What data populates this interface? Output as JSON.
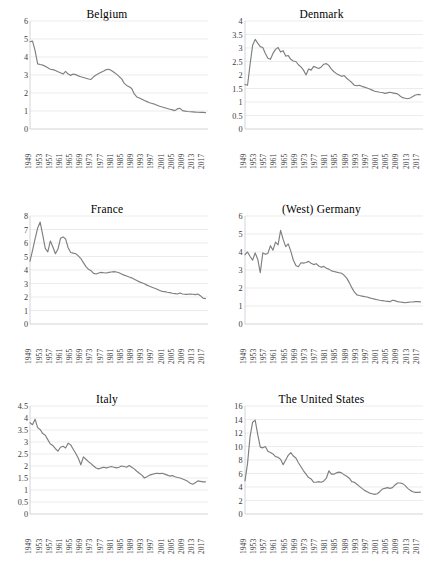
{
  "figure": {
    "panels": [
      {
        "id": "belgium",
        "title": "Belgium",
        "ylim": [
          0,
          6
        ],
        "yticks": [
          "0",
          "1",
          "2",
          "3",
          "4",
          "5",
          "6"
        ],
        "ytick_values": [
          0,
          1,
          2,
          3,
          4,
          5,
          6
        ]
      },
      {
        "id": "denmark",
        "title": "Denmark",
        "ylim": [
          0,
          4
        ],
        "yticks": [
          "0",
          "0.5",
          "1",
          "1.5",
          "2",
          "2.5",
          "3",
          "3.5",
          "4"
        ],
        "ytick_values": [
          0,
          0.5,
          1,
          1.5,
          2,
          2.5,
          3,
          3.5,
          4
        ]
      },
      {
        "id": "france",
        "title": "France",
        "ylim": [
          0,
          8
        ],
        "yticks": [
          "0",
          "1",
          "2",
          "3",
          "4",
          "5",
          "6",
          "7",
          "8"
        ],
        "ytick_values": [
          0,
          1,
          2,
          3,
          4,
          5,
          6,
          7,
          8
        ]
      },
      {
        "id": "west-germany",
        "title": "(West) Germany",
        "ylim": [
          0,
          6
        ],
        "yticks": [
          "0",
          "1",
          "2",
          "3",
          "4",
          "5",
          "6"
        ],
        "ytick_values": [
          0,
          1,
          2,
          3,
          4,
          5,
          6
        ]
      },
      {
        "id": "italy",
        "title": "Italy",
        "ylim": [
          0,
          4.5
        ],
        "yticks": [
          "0",
          "0.5",
          "1",
          "1.5",
          "2",
          "2.5",
          "3",
          "3.5",
          "4",
          "4.5"
        ],
        "ytick_values": [
          0,
          0.5,
          1,
          1.5,
          2,
          2.5,
          3,
          3.5,
          4,
          4.5
        ]
      },
      {
        "id": "united-states",
        "title": "The United States",
        "ylim": [
          0,
          16
        ],
        "yticks": [
          "0",
          "2",
          "4",
          "6",
          "8",
          "10",
          "12",
          "14",
          "16"
        ],
        "ytick_values": [
          0,
          2,
          4,
          6,
          8,
          10,
          12,
          14,
          16
        ]
      }
    ],
    "xticks": [
      "1949",
      "1953",
      "1957",
      "1961",
      "1965",
      "1969",
      "1973",
      "1977",
      "1981",
      "1985",
      "1989",
      "1993",
      "1997",
      "2001",
      "2005",
      "2009",
      "2013",
      "2017"
    ],
    "xlim": [
      1949,
      2019
    ],
    "line_color": "#7f7f7f",
    "gridline_color": "#e4e4e4"
  },
  "chart_data": [
    {
      "type": "line",
      "title": "Belgium",
      "xlabel": "",
      "ylabel": "",
      "ylim": [
        0,
        6
      ],
      "xlim": [
        1949,
        2019
      ],
      "grid": true,
      "legend": "none",
      "x": [
        1949,
        1950,
        1951,
        1952,
        1953,
        1954,
        1955,
        1956,
        1957,
        1958,
        1959,
        1960,
        1961,
        1962,
        1963,
        1964,
        1965,
        1966,
        1967,
        1968,
        1969,
        1970,
        1971,
        1972,
        1973,
        1974,
        1975,
        1976,
        1977,
        1978,
        1979,
        1980,
        1981,
        1982,
        1983,
        1984,
        1985,
        1986,
        1987,
        1988,
        1989,
        1990,
        1991,
        1992,
        1993,
        1994,
        1995,
        1996,
        1997,
        1998,
        1999,
        2000,
        2001,
        2002,
        2003,
        2004,
        2005,
        2006,
        2007,
        2008,
        2009,
        2010,
        2011,
        2012,
        2013,
        2014,
        2015,
        2016,
        2017,
        2018
      ],
      "values": [
        4.85,
        4.88,
        4.35,
        3.62,
        3.58,
        3.55,
        3.48,
        3.4,
        3.32,
        3.3,
        3.25,
        3.18,
        3.12,
        3.05,
        3.2,
        3.05,
        2.98,
        3.05,
        3.02,
        2.95,
        2.9,
        2.86,
        2.82,
        2.78,
        2.76,
        2.9,
        3.0,
        3.08,
        3.15,
        3.22,
        3.3,
        3.32,
        3.25,
        3.15,
        3.05,
        2.92,
        2.8,
        2.55,
        2.42,
        2.35,
        2.25,
        1.95,
        1.78,
        1.72,
        1.65,
        1.58,
        1.52,
        1.46,
        1.42,
        1.38,
        1.32,
        1.26,
        1.22,
        1.18,
        1.14,
        1.1,
        1.06,
        1.02,
        1.12,
        1.15,
        1.02,
        0.99,
        0.97,
        0.96,
        0.95,
        0.94,
        0.93,
        0.92,
        0.92,
        0.91
      ]
    },
    {
      "type": "line",
      "title": "Denmark",
      "xlabel": "",
      "ylabel": "",
      "ylim": [
        0,
        4
      ],
      "xlim": [
        1949,
        2019
      ],
      "grid": true,
      "legend": "none",
      "x": [
        1949,
        1950,
        1951,
        1952,
        1953,
        1954,
        1955,
        1956,
        1957,
        1958,
        1959,
        1960,
        1961,
        1962,
        1963,
        1964,
        1965,
        1966,
        1967,
        1968,
        1969,
        1970,
        1971,
        1972,
        1973,
        1974,
        1975,
        1976,
        1977,
        1978,
        1979,
        1980,
        1981,
        1982,
        1983,
        1984,
        1985,
        1986,
        1987,
        1988,
        1989,
        1990,
        1991,
        1992,
        1993,
        1994,
        1995,
        1996,
        1997,
        1998,
        1999,
        2000,
        2001,
        2002,
        2003,
        2004,
        2005,
        2006,
        2007,
        2008,
        2009,
        2010,
        2011,
        2012,
        2013,
        2014,
        2015,
        2016,
        2017,
        2018
      ],
      "values": [
        1.65,
        1.62,
        2.4,
        3.1,
        3.32,
        3.18,
        3.05,
        3.02,
        2.8,
        2.62,
        2.58,
        2.8,
        2.95,
        3.02,
        2.85,
        2.9,
        2.7,
        2.72,
        2.58,
        2.52,
        2.5,
        2.38,
        2.3,
        2.18,
        2.0,
        2.22,
        2.18,
        2.32,
        2.28,
        2.24,
        2.3,
        2.4,
        2.42,
        2.35,
        2.22,
        2.12,
        2.05,
        2.0,
        1.95,
        1.98,
        1.88,
        1.8,
        1.72,
        1.62,
        1.6,
        1.62,
        1.58,
        1.55,
        1.52,
        1.48,
        1.44,
        1.4,
        1.38,
        1.36,
        1.35,
        1.32,
        1.34,
        1.36,
        1.34,
        1.32,
        1.3,
        1.22,
        1.16,
        1.14,
        1.12,
        1.15,
        1.2,
        1.26,
        1.28,
        1.27
      ]
    },
    {
      "type": "line",
      "title": "France",
      "xlabel": "",
      "ylabel": "",
      "ylim": [
        0,
        8
      ],
      "xlim": [
        1949,
        2019
      ],
      "grid": true,
      "legend": "none",
      "x": [
        1949,
        1950,
        1951,
        1952,
        1953,
        1954,
        1955,
        1956,
        1957,
        1958,
        1959,
        1960,
        1961,
        1962,
        1963,
        1964,
        1965,
        1966,
        1967,
        1968,
        1969,
        1970,
        1971,
        1972,
        1973,
        1974,
        1975,
        1976,
        1977,
        1978,
        1979,
        1980,
        1981,
        1982,
        1983,
        1984,
        1985,
        1986,
        1987,
        1988,
        1989,
        1990,
        1991,
        1992,
        1993,
        1994,
        1995,
        1996,
        1997,
        1998,
        1999,
        2000,
        2001,
        2002,
        2003,
        2004,
        2005,
        2006,
        2007,
        2008,
        2009,
        2010,
        2011,
        2012,
        2013,
        2014,
        2015,
        2016,
        2017,
        2018
      ],
      "values": [
        4.65,
        5.45,
        6.3,
        7.1,
        7.55,
        6.6,
        5.6,
        5.35,
        6.15,
        5.7,
        5.2,
        5.55,
        6.35,
        6.45,
        6.3,
        5.65,
        5.3,
        5.25,
        5.2,
        5.05,
        4.85,
        4.55,
        4.25,
        4.05,
        3.95,
        3.75,
        3.7,
        3.78,
        3.82,
        3.8,
        3.78,
        3.82,
        3.85,
        3.88,
        3.85,
        3.8,
        3.7,
        3.62,
        3.55,
        3.48,
        3.42,
        3.32,
        3.22,
        3.12,
        3.05,
        2.98,
        2.88,
        2.8,
        2.72,
        2.65,
        2.58,
        2.48,
        2.42,
        2.4,
        2.35,
        2.32,
        2.28,
        2.25,
        2.22,
        2.3,
        2.22,
        2.2,
        2.2,
        2.22,
        2.2,
        2.18,
        2.22,
        2.1,
        1.92,
        1.88
      ]
    },
    {
      "type": "line",
      "title": "(West) Germany",
      "xlabel": "",
      "ylabel": "",
      "ylim": [
        0,
        6
      ],
      "xlim": [
        1949,
        2019
      ],
      "grid": true,
      "legend": "none",
      "x": [
        1949,
        1950,
        1951,
        1952,
        1953,
        1954,
        1955,
        1956,
        1957,
        1958,
        1959,
        1960,
        1961,
        1962,
        1963,
        1964,
        1965,
        1966,
        1967,
        1968,
        1969,
        1970,
        1971,
        1972,
        1973,
        1974,
        1975,
        1976,
        1977,
        1978,
        1979,
        1980,
        1981,
        1982,
        1983,
        1984,
        1985,
        1986,
        1987,
        1988,
        1989,
        1990,
        1991,
        1992,
        1993,
        1994,
        1995,
        1996,
        1997,
        1998,
        1999,
        2000,
        2001,
        2002,
        2003,
        2004,
        2005,
        2006,
        2007,
        2008,
        2009,
        2010,
        2011,
        2012,
        2013,
        2014,
        2015,
        2016,
        2017,
        2018
      ],
      "values": [
        3.85,
        4.0,
        3.75,
        3.55,
        3.95,
        3.6,
        2.85,
        3.95,
        3.88,
        3.92,
        4.35,
        4.1,
        4.55,
        4.4,
        5.2,
        4.7,
        4.3,
        4.45,
        4.05,
        3.55,
        3.25,
        3.18,
        3.4,
        3.38,
        3.42,
        3.48,
        3.38,
        3.3,
        3.35,
        3.22,
        3.15,
        3.2,
        3.1,
        3.05,
        2.95,
        2.92,
        2.88,
        2.85,
        2.82,
        2.7,
        2.55,
        2.3,
        2.02,
        1.78,
        1.62,
        1.58,
        1.55,
        1.52,
        1.5,
        1.45,
        1.42,
        1.38,
        1.35,
        1.32,
        1.3,
        1.28,
        1.26,
        1.24,
        1.32,
        1.3,
        1.24,
        1.22,
        1.2,
        1.18,
        1.2,
        1.22,
        1.22,
        1.24,
        1.24,
        1.23
      ]
    },
    {
      "type": "line",
      "title": "Italy",
      "xlabel": "",
      "ylabel": "",
      "ylim": [
        0,
        4.5
      ],
      "xlim": [
        1949,
        2019
      ],
      "grid": true,
      "legend": "none",
      "x": [
        1949,
        1950,
        1951,
        1952,
        1953,
        1954,
        1955,
        1956,
        1957,
        1958,
        1959,
        1960,
        1961,
        1962,
        1963,
        1964,
        1965,
        1966,
        1967,
        1968,
        1969,
        1970,
        1971,
        1972,
        1973,
        1974,
        1975,
        1976,
        1977,
        1978,
        1979,
        1980,
        1981,
        1982,
        1983,
        1984,
        1985,
        1986,
        1987,
        1988,
        1989,
        1990,
        1991,
        1992,
        1993,
        1994,
        1995,
        1996,
        1997,
        1998,
        1999,
        2000,
        2001,
        2002,
        2003,
        2004,
        2005,
        2006,
        2007,
        2008,
        2009,
        2010,
        2011,
        2012,
        2013,
        2014,
        2015,
        2016,
        2017,
        2018
      ],
      "values": [
        3.8,
        3.72,
        3.95,
        3.6,
        3.52,
        3.35,
        3.28,
        3.1,
        2.92,
        2.85,
        2.72,
        2.62,
        2.78,
        2.82,
        2.75,
        2.95,
        2.88,
        2.7,
        2.52,
        2.32,
        2.05,
        2.38,
        2.28,
        2.18,
        2.1,
        2.0,
        1.92,
        1.88,
        1.92,
        1.95,
        1.92,
        1.95,
        1.98,
        1.95,
        1.92,
        1.95,
        2.0,
        1.98,
        1.95,
        2.02,
        1.95,
        1.88,
        1.78,
        1.7,
        1.62,
        1.5,
        1.55,
        1.62,
        1.65,
        1.68,
        1.7,
        1.68,
        1.7,
        1.66,
        1.62,
        1.58,
        1.6,
        1.55,
        1.52,
        1.5,
        1.46,
        1.42,
        1.36,
        1.28,
        1.24,
        1.3,
        1.38,
        1.36,
        1.34,
        1.34
      ]
    },
    {
      "type": "line",
      "title": "The United States",
      "xlabel": "",
      "ylabel": "",
      "ylim": [
        0,
        16
      ],
      "xlim": [
        1949,
        2019
      ],
      "grid": true,
      "legend": "none",
      "x": [
        1949,
        1950,
        1951,
        1952,
        1953,
        1954,
        1955,
        1956,
        1957,
        1958,
        1959,
        1960,
        1961,
        1962,
        1963,
        1964,
        1965,
        1966,
        1967,
        1968,
        1969,
        1970,
        1971,
        1972,
        1973,
        1974,
        1975,
        1976,
        1977,
        1978,
        1979,
        1980,
        1981,
        1982,
        1983,
        1984,
        1985,
        1986,
        1987,
        1988,
        1989,
        1990,
        1991,
        1992,
        1993,
        1994,
        1995,
        1996,
        1997,
        1998,
        1999,
        2000,
        2001,
        2002,
        2003,
        2004,
        2005,
        2006,
        2007,
        2008,
        2009,
        2010,
        2011,
        2012,
        2013,
        2014,
        2015,
        2016,
        2017,
        2018
      ],
      "values": [
        4.9,
        7.5,
        11.5,
        13.6,
        13.9,
        11.8,
        9.9,
        9.8,
        10.0,
        9.3,
        9.1,
        8.9,
        8.5,
        8.4,
        8.1,
        7.3,
        8.0,
        8.7,
        9.1,
        8.6,
        8.3,
        7.6,
        7.0,
        6.4,
        5.9,
        5.4,
        5.2,
        4.7,
        4.7,
        4.8,
        4.7,
        4.9,
        5.3,
        6.4,
        5.9,
        5.9,
        6.1,
        6.2,
        6.1,
        5.8,
        5.6,
        5.3,
        4.8,
        4.7,
        4.4,
        4.1,
        3.8,
        3.5,
        3.3,
        3.1,
        3.0,
        2.9,
        3.0,
        3.3,
        3.7,
        3.8,
        3.9,
        3.8,
        3.9,
        4.3,
        4.6,
        4.6,
        4.5,
        4.2,
        3.8,
        3.5,
        3.3,
        3.2,
        3.2,
        3.25
      ]
    }
  ]
}
